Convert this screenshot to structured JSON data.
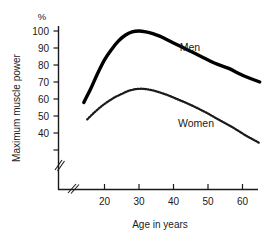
{
  "chart_data": {
    "type": "line",
    "title": "",
    "xlabel": "Age in years",
    "ylabel": "Maximum muscle power",
    "yunit": "%",
    "xlim": [
      13,
      66
    ],
    "ylim": [
      30,
      104
    ],
    "grid": false,
    "legend_position": "inline-labels",
    "axis_break_x": true,
    "axis_break_y": true,
    "xticks": [
      20,
      30,
      40,
      50,
      60
    ],
    "yticks": [
      40,
      50,
      60,
      70,
      80,
      90,
      100
    ],
    "series": [
      {
        "name": "Men",
        "style": "solid-thick",
        "color": "#000000",
        "x": [
          14,
          16,
          18,
          20,
          22,
          24,
          26,
          28,
          30,
          32,
          34,
          36,
          38,
          40,
          44,
          48,
          52,
          56,
          60,
          65
        ],
        "values": [
          58,
          66,
          75,
          83,
          89,
          94,
          97.5,
          99.5,
          100,
          99.5,
          98.5,
          97,
          95,
          93,
          89,
          85,
          81,
          78,
          74,
          70
        ]
      },
      {
        "name": "Women",
        "style": "dotted",
        "color": "#1a1a1a",
        "x": [
          15,
          17,
          19,
          21,
          23,
          25,
          27,
          29,
          31,
          33,
          35,
          38,
          41,
          45,
          49,
          53,
          57,
          61,
          65
        ],
        "values": [
          48,
          52,
          55.5,
          58.5,
          61,
          63,
          64.8,
          65.8,
          66,
          65.5,
          64.5,
          62.5,
          60,
          56.5,
          52.5,
          48,
          43.5,
          38.5,
          34
        ]
      }
    ],
    "annotations": [
      {
        "text": "Men",
        "x_px": 190,
        "y_px": 51
      },
      {
        "text": "Women",
        "x_px": 196,
        "y_px": 127
      }
    ]
  },
  "axis": {
    "y_unit": "%",
    "y_title": "Maximum muscle power",
    "x_title": "Age in years",
    "y_tick_labels": [
      "100",
      "90",
      "80",
      "70",
      "60",
      "50",
      "40"
    ],
    "x_tick_labels": [
      "20",
      "30",
      "40",
      "50",
      "60"
    ]
  },
  "labels": {
    "men": "Men",
    "women": "Women"
  }
}
